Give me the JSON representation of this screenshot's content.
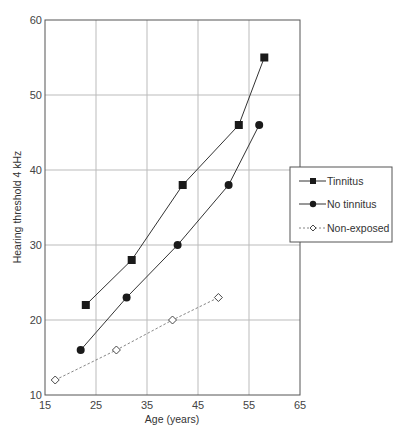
{
  "chart_data": {
    "type": "line",
    "title": "",
    "xlabel": "Age (years)",
    "ylabel": "Hearing threshold 4 kHz",
    "xlim": [
      15,
      65
    ],
    "ylim": [
      10,
      60
    ],
    "xticks": [
      15,
      25,
      35,
      45,
      55,
      65
    ],
    "yticks": [
      10,
      20,
      30,
      40,
      50,
      60
    ],
    "grid": true,
    "legend_position": "right, mid-height, overlapping plot edge",
    "series": [
      {
        "name": "Tinnitus",
        "marker": "filled-square",
        "line": "solid",
        "color": "#1a1a1a",
        "x": [
          23,
          32,
          42,
          53,
          58
        ],
        "y": [
          22,
          28,
          38,
          46,
          55
        ]
      },
      {
        "name": "No tinnitus",
        "marker": "filled-circle",
        "line": "solid",
        "color": "#1a1a1a",
        "x": [
          22,
          31,
          41,
          51,
          57
        ],
        "y": [
          16,
          23,
          30,
          38,
          46
        ]
      },
      {
        "name": "Non-exposed",
        "marker": "open-diamond",
        "line": "dashed",
        "color": "#555555",
        "x": [
          17,
          29,
          40,
          49
        ],
        "y": [
          12,
          16,
          20,
          23
        ]
      }
    ]
  },
  "axes": {
    "x_label": "Age (years)",
    "y_label": "Hearing threshold 4 kHz",
    "x_tick_labels": [
      "15",
      "25",
      "35",
      "45",
      "55",
      "65"
    ],
    "y_tick_labels": [
      "10",
      "20",
      "30",
      "40",
      "50",
      "60"
    ]
  },
  "legend": {
    "items": [
      {
        "label": "Tinnitus",
        "icon": "square-marker-icon"
      },
      {
        "label": "No tinnitus",
        "icon": "circle-marker-icon"
      },
      {
        "label": "Non-exposed",
        "icon": "diamond-marker-icon"
      }
    ]
  },
  "colors": {
    "frame": "#555555",
    "grid": "#bbbbbb",
    "series_line": "#333333",
    "marker_fill": "#1a1a1a"
  }
}
